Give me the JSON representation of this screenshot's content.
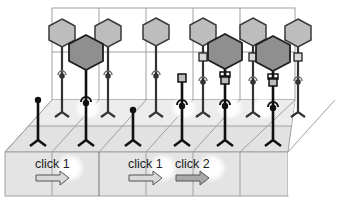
{
  "diagram": {
    "colors": {
      "wall_line": "#9a9a9a",
      "floor_fill": "#e4e4e4",
      "box_fill": "#e6e6e6",
      "hex_back": "#bdbdbd",
      "hex_front": "#8f8f8f",
      "hex_stroke": "#3a3a3a",
      "stem_dark": "#111111",
      "stem_mid": "#444444",
      "arrow_light": "#d4d4d4",
      "arrow_dark": "#a8a8a8"
    },
    "labels": [
      {
        "id": "click-1-left",
        "text": "click 1"
      },
      {
        "id": "click-1-middle",
        "text": "click 1"
      },
      {
        "id": "click-2",
        "text": "click 2"
      }
    ]
  }
}
